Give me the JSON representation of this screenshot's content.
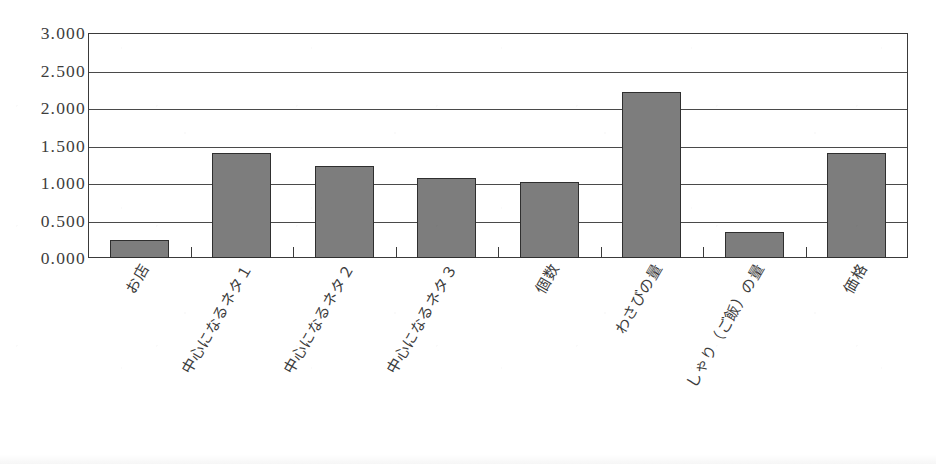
{
  "chart_data": {
    "type": "bar",
    "title": "",
    "subtitle": "",
    "xlabel": "",
    "ylabel": "",
    "ylim": [
      0,
      3
    ],
    "ytick_labels": [
      "3.000",
      "2.500",
      "2.000",
      "1.500",
      "1.000",
      "0.500",
      "0.000"
    ],
    "ytick_values": [
      3.0,
      2.5,
      2.0,
      1.5,
      1.0,
      0.5,
      0.0
    ],
    "ytick_step": 0.5,
    "grid": true,
    "grid_axis": "y",
    "legend": false,
    "legend_position": "none",
    "categories": [
      "お店",
      "中心になるネタ１",
      "中心になるネタ２",
      "中心になるネタ３",
      "個数",
      "わさびの量",
      "しゃり（ご飯）の量",
      "価格"
    ],
    "values": [
      0.24,
      1.4,
      1.23,
      1.07,
      1.02,
      2.21,
      0.35,
      1.4
    ],
    "bar_color": "#7d7d7d",
    "bar_border_color": "#2f2f2f",
    "axis_color": "#3a3a3a",
    "background_color": "#ffffff",
    "label_rotation_deg": -60
  }
}
